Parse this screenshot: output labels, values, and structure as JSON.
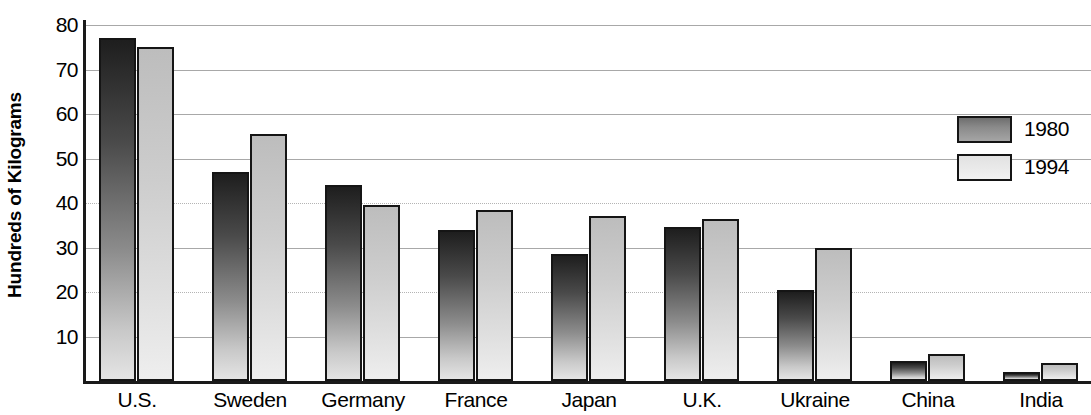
{
  "chart_data": {
    "type": "bar",
    "title": "",
    "xlabel": "",
    "ylabel": "Hundreds of Kilograms",
    "ylim": [
      0,
      84
    ],
    "yticks": [
      10,
      20,
      30,
      40,
      50,
      60,
      70,
      80
    ],
    "grid": true,
    "legend_position": "right",
    "categories": [
      "U.S.",
      "Sweden",
      "Germany",
      "France",
      "Japan",
      "U.K.",
      "Ukraine",
      "China",
      "India"
    ],
    "series": [
      {
        "name": "1980",
        "color": "#4a4a4a",
        "values": [
          77,
          47,
          44,
          34,
          28.5,
          34.5,
          20.5,
          4.5,
          2
        ]
      },
      {
        "name": "1994",
        "color": "#dedede",
        "values": [
          75,
          55.5,
          39.5,
          38.5,
          37,
          36.5,
          30,
          6,
          4
        ]
      }
    ]
  },
  "axis": {
    "y_title": "Hundreds of Kilograms",
    "tick_labels": [
      "80",
      "70",
      "60",
      "50",
      "40",
      "30",
      "20",
      "10"
    ]
  },
  "legend": {
    "entries": [
      {
        "label": "1980"
      },
      {
        "label": "1994"
      }
    ]
  }
}
